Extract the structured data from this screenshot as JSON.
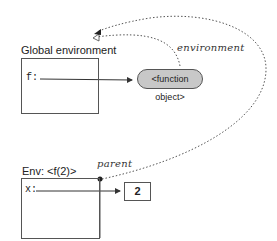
{
  "diagram": {
    "global_frame": {
      "title": "Global environment",
      "bindings": [
        {
          "name": "f:",
          "points_to": "function_object"
        }
      ]
    },
    "function_object": {
      "label": "<function object>",
      "fill": "#c8c8c8"
    },
    "local_frame": {
      "title": "Env: <f(2)>",
      "bindings": [
        {
          "name": "x:",
          "points_to": "value_2"
        }
      ]
    },
    "value_2": {
      "label": "2"
    },
    "annotations": {
      "environment": "environment",
      "parent": "parent"
    }
  }
}
